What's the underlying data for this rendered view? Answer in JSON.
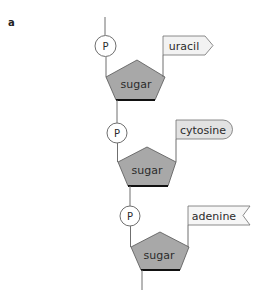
{
  "figure": {
    "panel_label": "a",
    "colors": {
      "line": "#6f6f6f",
      "sugar_fill": "#a8a8a8",
      "sugar_bottom_edge": "#111111",
      "phosphate_fill": "#ffffff",
      "uracil_fill": "#f2f2f2",
      "cytosine_fill": "#e2e2e2",
      "adenine_fill": "#f6f6f6"
    },
    "nucleotides": [
      {
        "phosphate": "P",
        "sugar": "sugar",
        "base": "uracil",
        "base_shape": "arrow"
      },
      {
        "phosphate": "P",
        "sugar": "sugar",
        "base": "cytosine",
        "base_shape": "rounded"
      },
      {
        "phosphate": "P",
        "sugar": "sugar",
        "base": "adenine",
        "base_shape": "notched"
      }
    ]
  }
}
